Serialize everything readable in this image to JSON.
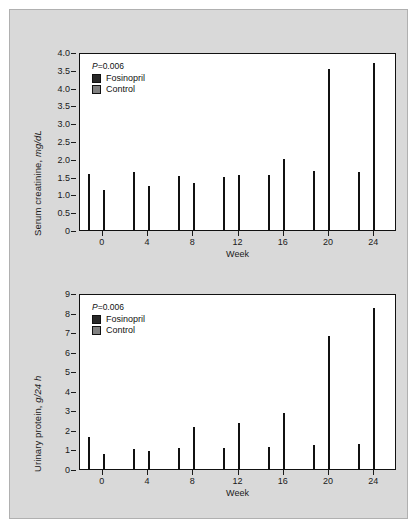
{
  "figure": {
    "background_color": "#d9d9d9",
    "border_color": "#b0b0b0",
    "colors": {
      "fosinopril": "#282828",
      "control": "#808080",
      "axis": "#111111",
      "plot_background": "#ffffff"
    }
  },
  "panels": [
    {
      "id": "serum-creatinine",
      "ylabel_plain": "Serum creatinine, ",
      "ylabel_italic": "mg/dL",
      "xlabel": "Week",
      "pvalue": "=0.006",
      "pvalue_symbol": "P",
      "legend": [
        {
          "label": "Fosinopril",
          "key": "fosinopril"
        },
        {
          "label": "Control",
          "key": "control"
        }
      ],
      "ytick_labels": [
        "4.0",
        "3.5",
        "4.0",
        "3.5",
        "3.0",
        "2.5",
        "2.0",
        "1.5",
        "1.0",
        "0.5",
        "0"
      ],
      "xtick_labels": [
        "0",
        "4",
        "8",
        "12",
        "16",
        "20",
        "24"
      ]
    },
    {
      "id": "urinary-protein",
      "ylabel_plain": "Urinary protein, ",
      "ylabel_italic": "g/24 h",
      "xlabel": "Week",
      "pvalue": "=0.006",
      "pvalue_symbol": "P",
      "legend": [
        {
          "label": "Fosinopril",
          "key": "fosinopril"
        },
        {
          "label": "Control",
          "key": "control"
        }
      ],
      "ytick_labels": [
        "9",
        "8",
        "7",
        "6",
        "5",
        "4",
        "3",
        "2",
        "1",
        "0"
      ],
      "xtick_labels": [
        "0",
        "4",
        "8",
        "12",
        "16",
        "20",
        "24"
      ]
    }
  ],
  "chart_data": [
    {
      "type": "bar",
      "title": "",
      "xlabel": "Week",
      "ylabel": "Serum creatinine, mg/dL",
      "categories": [
        "0",
        "4",
        "8",
        "12",
        "16",
        "20",
        "24"
      ],
      "series": [
        {
          "name": "Control",
          "color": "#808080",
          "values": [
            1.27,
            1.32,
            1.23,
            1.21,
            1.25,
            1.34,
            1.31
          ]
        },
        {
          "name": "Fosinopril",
          "color": "#282828",
          "values": [
            0.92,
            1.0,
            1.06,
            1.25,
            1.62,
            3.65,
            3.79
          ]
        }
      ],
      "series_draw_order": [
        "Control",
        "Fosinopril"
      ],
      "legend_order": [
        "Fosinopril",
        "Control"
      ],
      "ylim": [
        0,
        4.0
      ],
      "ytick_values": [
        4.0,
        3.5,
        4.0,
        3.5,
        3.0,
        2.5,
        2.0,
        1.5,
        1.0,
        0.5,
        0
      ],
      "ytick_note": "top two labels are a duplicated-label artifact in the scanned source",
      "grid": false,
      "legend_position": "top-left",
      "annotations": [
        "P=0.006"
      ]
    },
    {
      "type": "bar",
      "title": "",
      "xlabel": "Week",
      "ylabel": "Urinary protein, g/24 h",
      "categories": [
        "0",
        "4",
        "8",
        "12",
        "16",
        "20",
        "24"
      ],
      "series": [
        {
          "name": "Control",
          "color": "#808080",
          "values": [
            1.65,
            1.06,
            1.07,
            1.09,
            1.16,
            1.24,
            1.29
          ]
        },
        {
          "name": "Fosinopril",
          "color": "#282828",
          "values": [
            0.76,
            0.93,
            2.18,
            2.38,
            2.88,
            6.89,
            8.32
          ]
        }
      ],
      "series_draw_order": [
        "Control",
        "Fosinopril"
      ],
      "legend_order": [
        "Fosinopril",
        "Control"
      ],
      "ylim": [
        0,
        9
      ],
      "ytick_values": [
        9,
        8,
        7,
        6,
        5,
        4,
        3,
        2,
        1,
        0
      ],
      "grid": false,
      "legend_position": "top-left",
      "annotations": [
        "P=0.006"
      ]
    }
  ]
}
